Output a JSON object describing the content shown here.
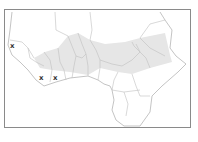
{
  "map": {
    "region": "West Africa",
    "colors": {
      "frame": "#8a8a8a",
      "border": "#b5b5b5",
      "shade": "#e6e6e6",
      "marker": "#333333",
      "background": "#ffffff"
    },
    "markers": [
      {
        "label": "x",
        "x": 10,
        "y": 43
      },
      {
        "label": "x",
        "x": 39,
        "y": 75
      },
      {
        "label": "x",
        "x": 53,
        "y": 75
      }
    ]
  }
}
